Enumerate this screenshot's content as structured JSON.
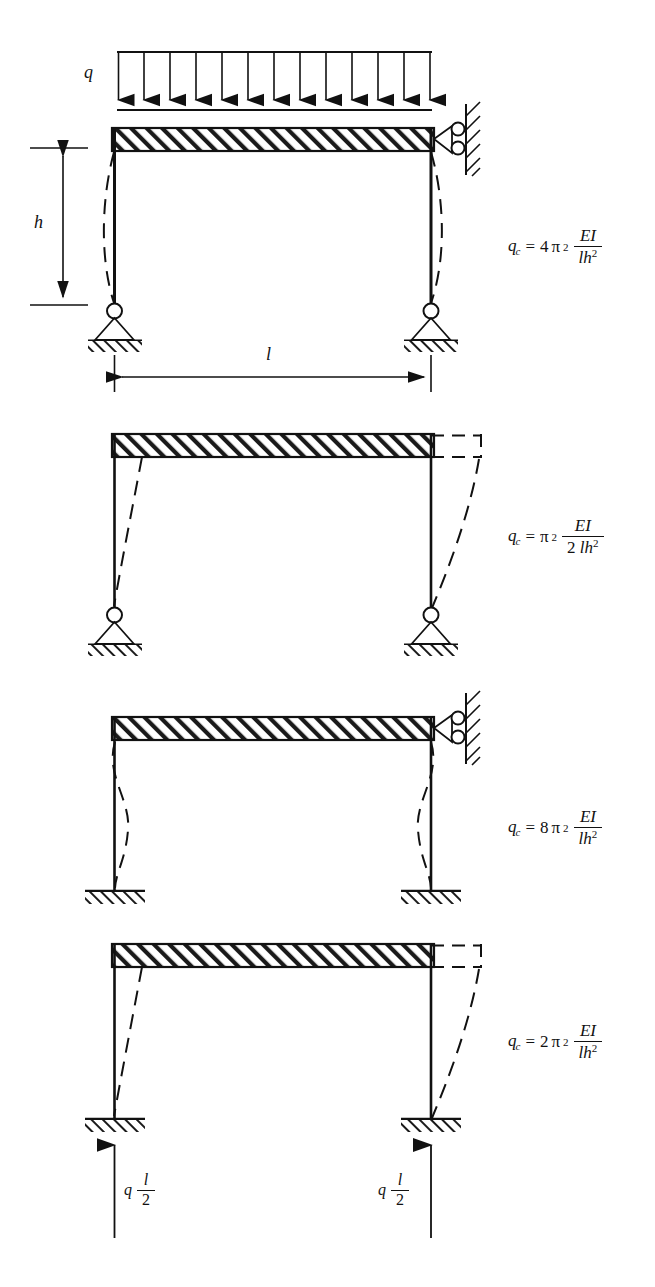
{
  "figure": {
    "type": "structural-engineering-diagram",
    "line_color": "#111111",
    "background": "#ffffff"
  },
  "labels": {
    "load_q": "q",
    "height_h": "h",
    "span_l": "l"
  },
  "reactions": {
    "left": {
      "symbol": "q",
      "numerator": "l",
      "denominator": "2"
    },
    "right": {
      "symbol": "q",
      "numerator": "l",
      "denominator": "2"
    }
  },
  "cases": [
    {
      "id": "case-1",
      "base_support": "pinned",
      "top_right_support": "horizontal-roller-on-wall",
      "buckling_mode": "symmetric-non-sway",
      "formula": {
        "lhs": "q",
        "lhs_sub": "c",
        "equals": "=",
        "coefficient": "4",
        "pi": "π",
        "pi_exp": "2",
        "numerator": "EI",
        "denominator_l": "l",
        "denominator_h": "h",
        "denominator_h_exp": "2",
        "plain": "q_c = 4π² EI / (lh²)"
      },
      "has_distributed_load": true,
      "load_arrow_count": 13,
      "has_dimensions": true
    },
    {
      "id": "case-2",
      "base_support": "pinned",
      "top_right_support": "free",
      "buckling_mode": "sway",
      "formula": {
        "lhs": "q",
        "lhs_sub": "c",
        "equals": "=",
        "coefficient": "",
        "pi": "π",
        "pi_exp": "2",
        "numerator": "EI",
        "denominator_prefix": "2",
        "denominator_l": "l",
        "denominator_h": "h",
        "denominator_h_exp": "2",
        "plain": "q_c = π² EI / (2 lh²)"
      },
      "has_distributed_load": false,
      "has_dimensions": false
    },
    {
      "id": "case-3",
      "base_support": "fixed",
      "top_right_support": "horizontal-roller-on-wall",
      "buckling_mode": "symmetric-non-sway-double-curvature",
      "formula": {
        "lhs": "q",
        "lhs_sub": "c",
        "equals": "=",
        "coefficient": "8",
        "pi": "π",
        "pi_exp": "2",
        "numerator": "EI",
        "denominator_l": "l",
        "denominator_h": "h",
        "denominator_h_exp": "2",
        "plain": "q_c = 8π² EI / (lh²)"
      },
      "has_distributed_load": false,
      "has_dimensions": false
    },
    {
      "id": "case-4",
      "base_support": "fixed",
      "top_right_support": "free",
      "buckling_mode": "sway",
      "formula": {
        "lhs": "q",
        "lhs_sub": "c",
        "equals": "=",
        "coefficient": "2",
        "pi": "π",
        "pi_exp": "2",
        "numerator": "EI",
        "denominator_l": "l",
        "denominator_h": "h",
        "denominator_h_exp": "2",
        "plain": "q_c = 2π² EI / (lh²)"
      },
      "has_distributed_load": false,
      "has_reactions": true,
      "has_dimensions": false
    }
  ]
}
